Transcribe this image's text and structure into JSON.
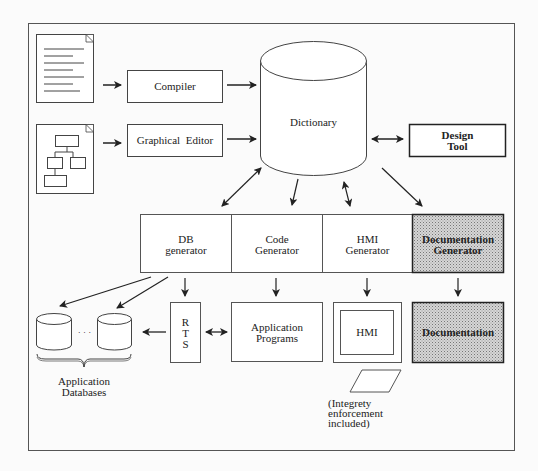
{
  "diagram": {
    "nodes": {
      "source_text_document": {
        "label": ""
      },
      "source_graphic_document": {
        "label": ""
      },
      "compiler": {
        "label": "Compiler"
      },
      "graphical_editor": {
        "label": "Graphical  Editor"
      },
      "dictionary": {
        "label": "Dictionary"
      },
      "design_tool": {
        "label_line1": "Design",
        "label_line2": "Tool"
      },
      "db_generator": {
        "label_line1": "DB",
        "label_line2": "generator"
      },
      "code_generator": {
        "label_line1": "Code",
        "label_line2": "Generator"
      },
      "hmi_generator": {
        "label_line1": "HMI",
        "label_line2": "Generator"
      },
      "documentation_generator": {
        "label_line1": "Documentation",
        "label_line2": "Generator"
      },
      "rts": {
        "label_line1": "R",
        "label_line2": "T",
        "label_line3": "S"
      },
      "application_programs": {
        "label_line1": "Application",
        "label_line2": "Programs"
      },
      "hmi": {
        "label": "HMI"
      },
      "documentation": {
        "label": "Documentation"
      },
      "application_databases": {
        "label_line1": "Application",
        "label_line2": "Databases",
        "ellipsis": "· · ·"
      },
      "integrity_note": {
        "line1": "(Integrety",
        "line2": "enforcement",
        "line3": "included)"
      }
    },
    "edges": [
      {
        "from": "source_text_document",
        "to": "compiler",
        "type": "directed"
      },
      {
        "from": "source_graphic_document",
        "to": "graphical_editor",
        "type": "directed"
      },
      {
        "from": "compiler",
        "to": "dictionary",
        "type": "directed"
      },
      {
        "from": "graphical_editor",
        "to": "dictionary",
        "type": "directed"
      },
      {
        "from": "dictionary",
        "to": "design_tool",
        "type": "bidirectional"
      },
      {
        "from": "dictionary",
        "to": "db_generator",
        "type": "bidirectional"
      },
      {
        "from": "dictionary",
        "to": "code_generator",
        "type": "directed"
      },
      {
        "from": "dictionary",
        "to": "hmi_generator",
        "type": "bidirectional"
      },
      {
        "from": "dictionary",
        "to": "documentation_generator",
        "type": "directed"
      },
      {
        "from": "db_generator",
        "to": "application_databases",
        "type": "directed",
        "count": 2
      },
      {
        "from": "db_generator",
        "to": "rts",
        "type": "directed"
      },
      {
        "from": "code_generator",
        "to": "application_programs",
        "type": "directed"
      },
      {
        "from": "hmi_generator",
        "to": "hmi",
        "type": "directed"
      },
      {
        "from": "documentation_generator",
        "to": "documentation",
        "type": "directed"
      },
      {
        "from": "rts",
        "to": "application_databases",
        "type": "directed"
      },
      {
        "from": "rts",
        "to": "application_programs",
        "type": "bidirectional"
      }
    ],
    "colors": {
      "line": "#333333",
      "shaded_fill": "#c8c8c8",
      "background": "#fbfbfb"
    }
  }
}
